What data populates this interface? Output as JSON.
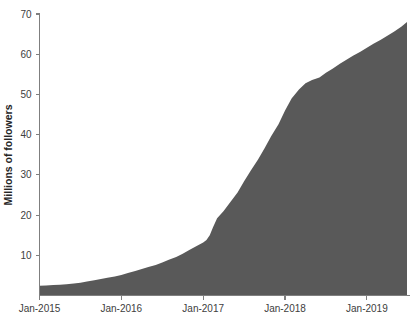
{
  "chart_data": {
    "type": "area",
    "title": "",
    "subtitle": "",
    "xlabel": "",
    "ylabel": "Millions of followers",
    "grid": false,
    "legend": "none",
    "series_color": "#595959",
    "ylim": [
      0,
      70
    ],
    "yticks": [
      0,
      10,
      20,
      30,
      40,
      50,
      60,
      70
    ],
    "ytick_labels": [
      "",
      "10",
      "20",
      "30",
      "40",
      "50",
      "60",
      "70"
    ],
    "xtick_labels": [
      "Jan-2015",
      "Jan-2016",
      "Jan-2017",
      "Jan-2018",
      "Jan-2019"
    ],
    "xtick_values": [
      2015.0,
      2016.0,
      2017.0,
      2018.0,
      2019.0
    ],
    "xlim": [
      2015.0,
      2019.49
    ],
    "series": [
      {
        "name": "Followers",
        "x": [
          2015.0,
          2015.08,
          2015.17,
          2015.25,
          2015.33,
          2015.42,
          2015.5,
          2015.58,
          2015.67,
          2015.75,
          2015.83,
          2015.92,
          2016.0,
          2016.08,
          2016.17,
          2016.25,
          2016.33,
          2016.42,
          2016.5,
          2016.58,
          2016.67,
          2016.75,
          2016.83,
          2016.92,
          2017.0,
          2017.04,
          2017.08,
          2017.12,
          2017.17,
          2017.25,
          2017.33,
          2017.42,
          2017.5,
          2017.58,
          2017.67,
          2017.75,
          2017.83,
          2017.92,
          2018.0,
          2018.08,
          2018.17,
          2018.25,
          2018.33,
          2018.42,
          2018.5,
          2018.58,
          2018.67,
          2018.75,
          2018.83,
          2018.92,
          2019.0,
          2019.08,
          2019.17,
          2019.25,
          2019.33,
          2019.42,
          2019.49
        ],
        "values": [
          2.4,
          2.5,
          2.6,
          2.7,
          2.8,
          3.0,
          3.2,
          3.5,
          3.8,
          4.1,
          4.4,
          4.7,
          5.1,
          5.6,
          6.1,
          6.6,
          7.1,
          7.6,
          8.2,
          8.9,
          9.6,
          10.4,
          11.3,
          12.3,
          13.2,
          13.8,
          15.0,
          17.0,
          19.2,
          21.0,
          23.2,
          25.6,
          28.4,
          31.0,
          33.8,
          36.6,
          39.6,
          42.6,
          46.0,
          49.0,
          51.2,
          52.8,
          53.6,
          54.2,
          55.4,
          56.4,
          57.6,
          58.6,
          59.6,
          60.6,
          61.6,
          62.6,
          63.6,
          64.6,
          65.6,
          66.8,
          68.0
        ]
      }
    ]
  }
}
